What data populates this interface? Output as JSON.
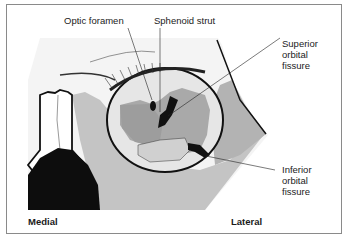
{
  "figure": {
    "type": "anatomical-diagram",
    "subject": "orbit",
    "colors": {
      "frame": "#8a8a8a",
      "bone_light": "#f2f2f2",
      "tissue_gray": "#bdbdbd",
      "orbit_floor": "#cfcfcf",
      "deep_gray": "#9e9e9e",
      "ink": "#111111"
    }
  },
  "labels": {
    "optic_foramen": "Optic foramen",
    "sphenoid_strut": "Sphenoid strut",
    "superior_orbital_fissure": [
      "Superior",
      "orbital",
      "fissure"
    ],
    "inferior_orbital_fissure": [
      "Inferior",
      "orbital",
      "fissure"
    ],
    "medial": "Medial",
    "lateral": "Lateral"
  }
}
